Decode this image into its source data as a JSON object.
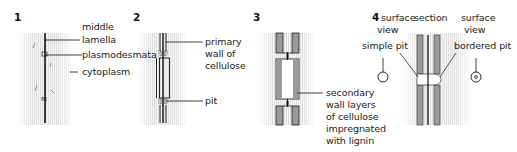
{
  "figure": {
    "panels": [
      {
        "number": "1",
        "labels": {
          "middle_lamella": "middle\nlamella",
          "middle_lamella_line1": "middle",
          "middle_lamella_line2": "lamella",
          "plasmodesmata": "plasmodesmata",
          "cytoplasm": "cytoplasm"
        }
      },
      {
        "number": "2",
        "labels": {
          "primary_wall_line1": "primary",
          "primary_wall_line2": "wall of",
          "primary_wall_line3": "cellulose",
          "pit": "pit"
        }
      },
      {
        "number": "3",
        "labels": {
          "secondary_line1": "secondary",
          "secondary_line2": "wall layers",
          "secondary_line3": "of cellulose",
          "secondary_line4": "impregnated",
          "secondary_line5": "with lignin"
        }
      },
      {
        "number": "4",
        "labels": {
          "surface_view_left_line1": "surface",
          "surface_view_left_line2": "view",
          "section": "section",
          "surface_view_right_line1": "surface",
          "surface_view_right_line2": "view",
          "simple_pit": "simple pit",
          "bordered_pit": "bordered pit"
        }
      }
    ],
    "colors": {
      "cytoplasm_stripe": "#e4e4e4",
      "secondary_wall": "#9a9a9a",
      "line": "#111111"
    }
  }
}
